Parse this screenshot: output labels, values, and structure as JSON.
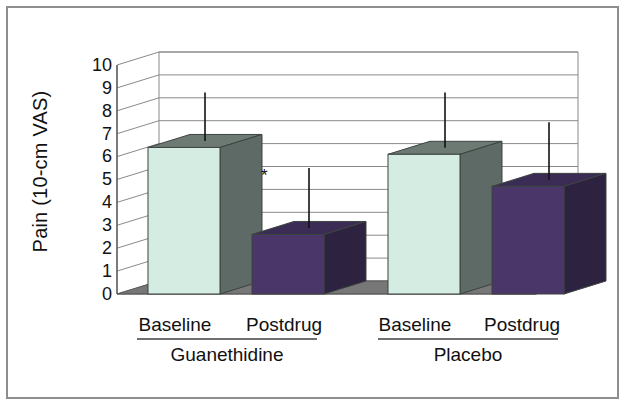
{
  "chart_data": {
    "type": "bar",
    "title": "",
    "xlabel": "",
    "ylabel": "Pain (10-cm VAS)",
    "ylim": [
      0,
      10
    ],
    "ytick_labels": [
      "10",
      "9",
      "8",
      "7",
      "6",
      "5",
      "4",
      "3",
      "2",
      "1",
      "0"
    ],
    "ytick_values": [
      10,
      9,
      8,
      7,
      6,
      5,
      4,
      3,
      2,
      1,
      0
    ],
    "grid": true,
    "legend": "none",
    "style": "3d-column",
    "group_labels": [
      "Guanethidine",
      "Placebo"
    ],
    "categories": [
      "Baseline",
      "Postdrug",
      "Baseline",
      "Postdrug"
    ],
    "values": [
      6.4,
      2.6,
      6.1,
      4.7
    ],
    "error_upper": [
      8.8,
      5.5,
      8.8,
      7.5
    ],
    "bars": [
      {
        "group": "Guanethidine",
        "category": "Baseline",
        "value": 6.4,
        "error_top": 8.8,
        "color": "light",
        "significant": false
      },
      {
        "group": "Guanethidine",
        "category": "Postdrug",
        "value": 2.6,
        "error_top": 5.5,
        "color": "dark",
        "significant": true
      },
      {
        "group": "Placebo",
        "category": "Baseline",
        "value": 6.1,
        "error_top": 8.8,
        "color": "light",
        "significant": false
      },
      {
        "group": "Placebo",
        "category": "Postdrug",
        "value": 4.7,
        "error_top": 7.5,
        "color": "dark",
        "significant": false
      }
    ],
    "annotations": [
      {
        "text": "*",
        "bar_index": 1,
        "meaning": "significant"
      }
    ]
  },
  "colors": {
    "light_bar_front": "#d5ece2",
    "light_bar_top": "#6d7a74",
    "light_bar_side": "#5d6a65",
    "dark_bar_front": "#4a3668",
    "dark_bar_top": "#3b2c55",
    "dark_bar_side": "#2d2240",
    "floor": "#777777",
    "floor_edge": "#5a5a5a",
    "grid": "#8a8a8a",
    "axis": "#5a5a5a",
    "frame_border": "#8e8e8e",
    "background": "#ffffff",
    "text": "#111111"
  }
}
